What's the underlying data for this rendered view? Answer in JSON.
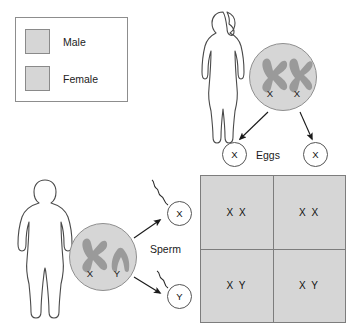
{
  "diagram": {
    "colors": {
      "swatch_fill": "#d6d6d6",
      "cell_fill": "#d6d6d6",
      "chromosome_gray": "#9a9a9a",
      "outline": "#555555",
      "punnett_fill": "#d6d6d6",
      "punnett_border": "#7d7d7d"
    }
  },
  "legend": {
    "items": [
      {
        "label": "Male",
        "swatch_color": "#d6d6d6",
        "icon": "square-swatch"
      },
      {
        "label": "Female",
        "swatch_color": "#d6d6d6",
        "icon": "square-swatch"
      }
    ]
  },
  "female_parent": {
    "figure_icon": "female-body-silhouette",
    "cell_icon": "cell-circle",
    "chromosomes": [
      {
        "symbol": "X",
        "shape": "x-chromosome"
      },
      {
        "symbol": "X",
        "shape": "x-chromosome"
      }
    ],
    "gametes_label": "Eggs",
    "gametes": [
      {
        "symbol": "X"
      },
      {
        "symbol": "X"
      }
    ]
  },
  "male_parent": {
    "figure_icon": "male-body-silhouette",
    "cell_icon": "cell-circle",
    "chromosomes": [
      {
        "symbol": "X",
        "shape": "x-chromosome"
      },
      {
        "symbol": "Y",
        "shape": "y-chromosome"
      }
    ],
    "gametes_label": "Sperm",
    "gametes": [
      {
        "symbol": "X"
      },
      {
        "symbol": "Y"
      }
    ]
  },
  "punnett_square": {
    "cells": [
      {
        "genotype": "X X",
        "row": 0,
        "col": 0
      },
      {
        "genotype": "X X",
        "row": 0,
        "col": 1
      },
      {
        "genotype": "X Y",
        "row": 1,
        "col": 0
      },
      {
        "genotype": "X Y",
        "row": 1,
        "col": 1
      }
    ]
  }
}
